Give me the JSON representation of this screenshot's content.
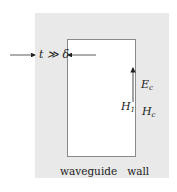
{
  "diagram": {
    "title": "",
    "thickness_label": {
      "text": "t ≫ δ"
    },
    "field_labels": {
      "E_c": {
        "base": "E",
        "sub": "c"
      },
      "H_1": {
        "base": "H",
        "sub": "1"
      },
      "H_c": {
        "base": "H",
        "sub": "c"
      }
    },
    "caption": {
      "word1": "waveguide",
      "word2": "wall"
    },
    "colors": {
      "wall": "#e9e9e9",
      "interior": "#ffffff",
      "line": "#333333"
    }
  }
}
